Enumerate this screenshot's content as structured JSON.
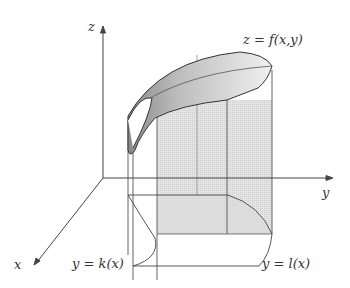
{
  "diagram": {
    "axes": {
      "z_label": "z",
      "y_label": "y",
      "x_label": "x"
    },
    "surface_label": "z = f(x,y)",
    "lower_curve_label": "y = k(x)",
    "upper_curve_label": "y = l(x)",
    "colors": {
      "line": "#444444",
      "shade_light": "#e6e6e6",
      "shade_mid": "#cfcfcf",
      "shade_dark": "#9a9a9a"
    }
  }
}
